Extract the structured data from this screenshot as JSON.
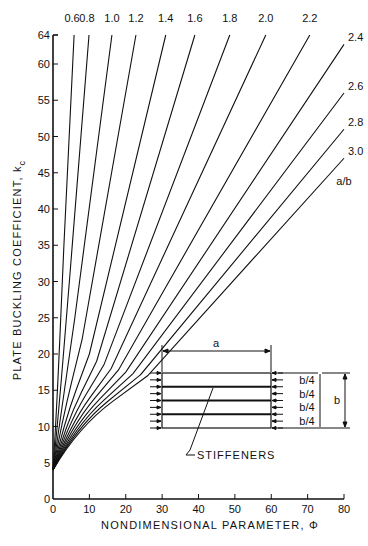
{
  "chart_data": {
    "type": "line",
    "title": "",
    "xlabel": "NONDIMENSIONAL PARAMETER, Φ",
    "ylabel": "PLATE BUCKLING COEFFICIENT, k",
    "ylabel_subscript": "c",
    "xlim": [
      0,
      80
    ],
    "ylim": [
      0,
      64
    ],
    "x_ticks": [
      0,
      10,
      20,
      30,
      40,
      50,
      60,
      70,
      80
    ],
    "y_ticks": [
      0,
      5,
      10,
      15,
      20,
      25,
      30,
      35,
      40,
      45,
      50,
      55,
      60,
      64
    ],
    "grid": false,
    "legend_title": "a/b",
    "series": [
      {
        "name": "0.6",
        "x": [
          0,
          1,
          3,
          5.8
        ],
        "y": [
          4,
          12,
          35,
          64
        ]
      },
      {
        "name": "0.8",
        "x": [
          0,
          1.5,
          4.5,
          9.9
        ],
        "y": [
          4,
          11.5,
          30,
          64
        ]
      },
      {
        "name": "1.0",
        "x": [
          0,
          2,
          6,
          16.2
        ],
        "y": [
          4,
          11,
          25,
          64
        ]
      },
      {
        "name": "1.2",
        "x": [
          0,
          2.5,
          8,
          22.8
        ],
        "y": [
          4,
          10.8,
          22,
          64
        ]
      },
      {
        "name": "1.4",
        "x": [
          0,
          3,
          10,
          31
        ],
        "y": [
          4,
          10.5,
          20,
          64
        ]
      },
      {
        "name": "1.6",
        "x": [
          0,
          3.5,
          12,
          39
        ],
        "y": [
          4,
          10.3,
          19,
          64
        ]
      },
      {
        "name": "1.8",
        "x": [
          0,
          4,
          14,
          48.6
        ],
        "y": [
          4,
          10.2,
          18.5,
          64
        ]
      },
      {
        "name": "2.0",
        "x": [
          0,
          4.5,
          16,
          58.5
        ],
        "y": [
          4,
          10.1,
          18,
          64
        ]
      },
      {
        "name": "2.2",
        "x": [
          0,
          5,
          18,
          70.6
        ],
        "y": [
          4,
          10,
          17.8,
          64
        ]
      },
      {
        "name": "2.4",
        "x": [
          0,
          5.5,
          20,
          80
        ],
        "y": [
          4,
          10,
          17.5,
          62.7
        ]
      },
      {
        "name": "2.6",
        "x": [
          0,
          6,
          22,
          80
        ],
        "y": [
          4,
          10,
          17.3,
          56
        ]
      },
      {
        "name": "2.8",
        "x": [
          0,
          6.5,
          24,
          80
        ],
        "y": [
          4,
          10,
          17.1,
          51
        ]
      },
      {
        "name": "3.0",
        "x": [
          0,
          7,
          26,
          80
        ],
        "y": [
          4,
          10,
          17,
          47
        ]
      }
    ],
    "annotations": {
      "inset_dimension_a": "a",
      "inset_dimension_b": "b",
      "inset_spacing_labels": [
        "b/4",
        "b/4",
        "b/4",
        "b/4"
      ],
      "inset_callout": "STIFFENERS"
    }
  },
  "axis": {
    "x_title": "NONDIMENSIONAL PARAMETER, Φ",
    "y_title": "PLATE BUCKLING COEFFICIENT, k",
    "y_title_sub": "c",
    "legend_title": "a/b"
  },
  "inset": {
    "a_label": "a",
    "b_label": "b",
    "spacing_label": "b/4",
    "callout": "STIFFENERS"
  },
  "colors": {
    "ink": "#111111",
    "background": "#ffffff"
  }
}
